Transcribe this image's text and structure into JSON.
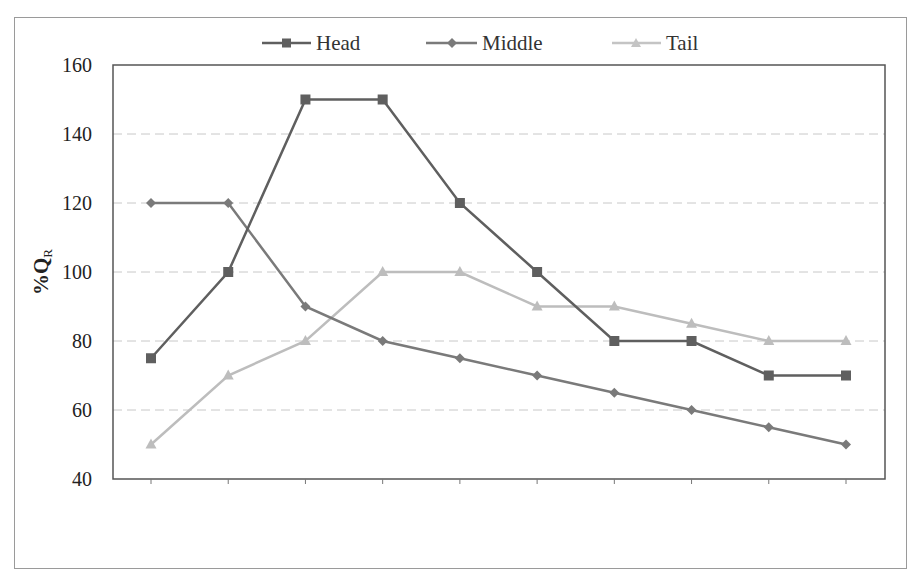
{
  "chart_data": {
    "type": "line",
    "title": "",
    "xlabel": "",
    "ylabel": "%Q_R",
    "ylabel_main": "%Q",
    "ylabel_sub": "R",
    "ylim": [
      40,
      160
    ],
    "yticks": [
      40,
      60,
      80,
      100,
      120,
      140,
      160
    ],
    "grid": "horizontal-dashed",
    "legend_position": "top",
    "x": [
      1,
      2,
      3,
      4,
      5,
      6,
      7,
      8,
      9,
      10
    ],
    "series": [
      {
        "name": "Head",
        "marker": "square",
        "color": "#5f5f5f",
        "values": [
          75,
          100,
          150,
          150,
          120,
          100,
          80,
          80,
          70,
          70
        ]
      },
      {
        "name": "Middle",
        "marker": "diamond",
        "color": "#7a7a7a",
        "values": [
          120,
          120,
          90,
          80,
          75,
          70,
          65,
          60,
          55,
          50
        ]
      },
      {
        "name": "Tail",
        "marker": "triangle",
        "color": "#bdbdbd",
        "values": [
          50,
          70,
          80,
          100,
          100,
          90,
          90,
          85,
          80,
          80
        ]
      }
    ]
  },
  "legend": {
    "items": [
      {
        "label": "Head"
      },
      {
        "label": "Middle"
      },
      {
        "label": "Tail"
      }
    ]
  },
  "yaxis": {
    "labels": [
      "160",
      "140",
      "120",
      "100",
      "80",
      "60",
      "40"
    ],
    "title_main": "%Q",
    "title_sub": "R"
  }
}
